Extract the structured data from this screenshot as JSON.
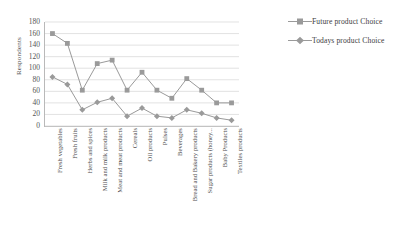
{
  "chart_data": {
    "type": "line",
    "title": "",
    "xlabel": "",
    "ylabel": "Respondents",
    "ylim": [
      0,
      180
    ],
    "ytick_step": 20,
    "yticks": [
      "180",
      "160",
      "140",
      "120",
      "100",
      "80",
      "60",
      "40",
      "20",
      "0"
    ],
    "grid": true,
    "legend_position": "right",
    "categories": [
      "Fresh vegetables",
      "Fresh fruits",
      "Herbs and spices",
      "Milk and milk products",
      "Meat and meat products",
      "Cereals",
      "Oil products",
      "Pulses",
      "Beverages",
      "Bread and Bakery products",
      "Sugar products (honey...",
      "Baby Products",
      "Textiles products"
    ],
    "series": [
      {
        "name": "Future product Choice",
        "marker": "square",
        "color": "#9a9a9a",
        "values": [
          160,
          143,
          62,
          108,
          114,
          62,
          93,
          62,
          48,
          82,
          62,
          40,
          40
        ]
      },
      {
        "name": "Todays product Choice",
        "marker": "diamond",
        "color": "#9a9a9a",
        "values": [
          85,
          72,
          28,
          41,
          48,
          17,
          31,
          17,
          14,
          28,
          22,
          14,
          10
        ]
      }
    ]
  },
  "axis": {
    "y_title": "Respondents"
  },
  "legend": {
    "items": [
      {
        "label": "Future product Choice"
      },
      {
        "label": "Todays product Choice"
      }
    ]
  },
  "colors": {
    "series": "#9a9a9a",
    "grid": "#d6d6d6",
    "axis": "#b0b0b0",
    "text": "#4a4a4a",
    "background": "#ffffff"
  }
}
